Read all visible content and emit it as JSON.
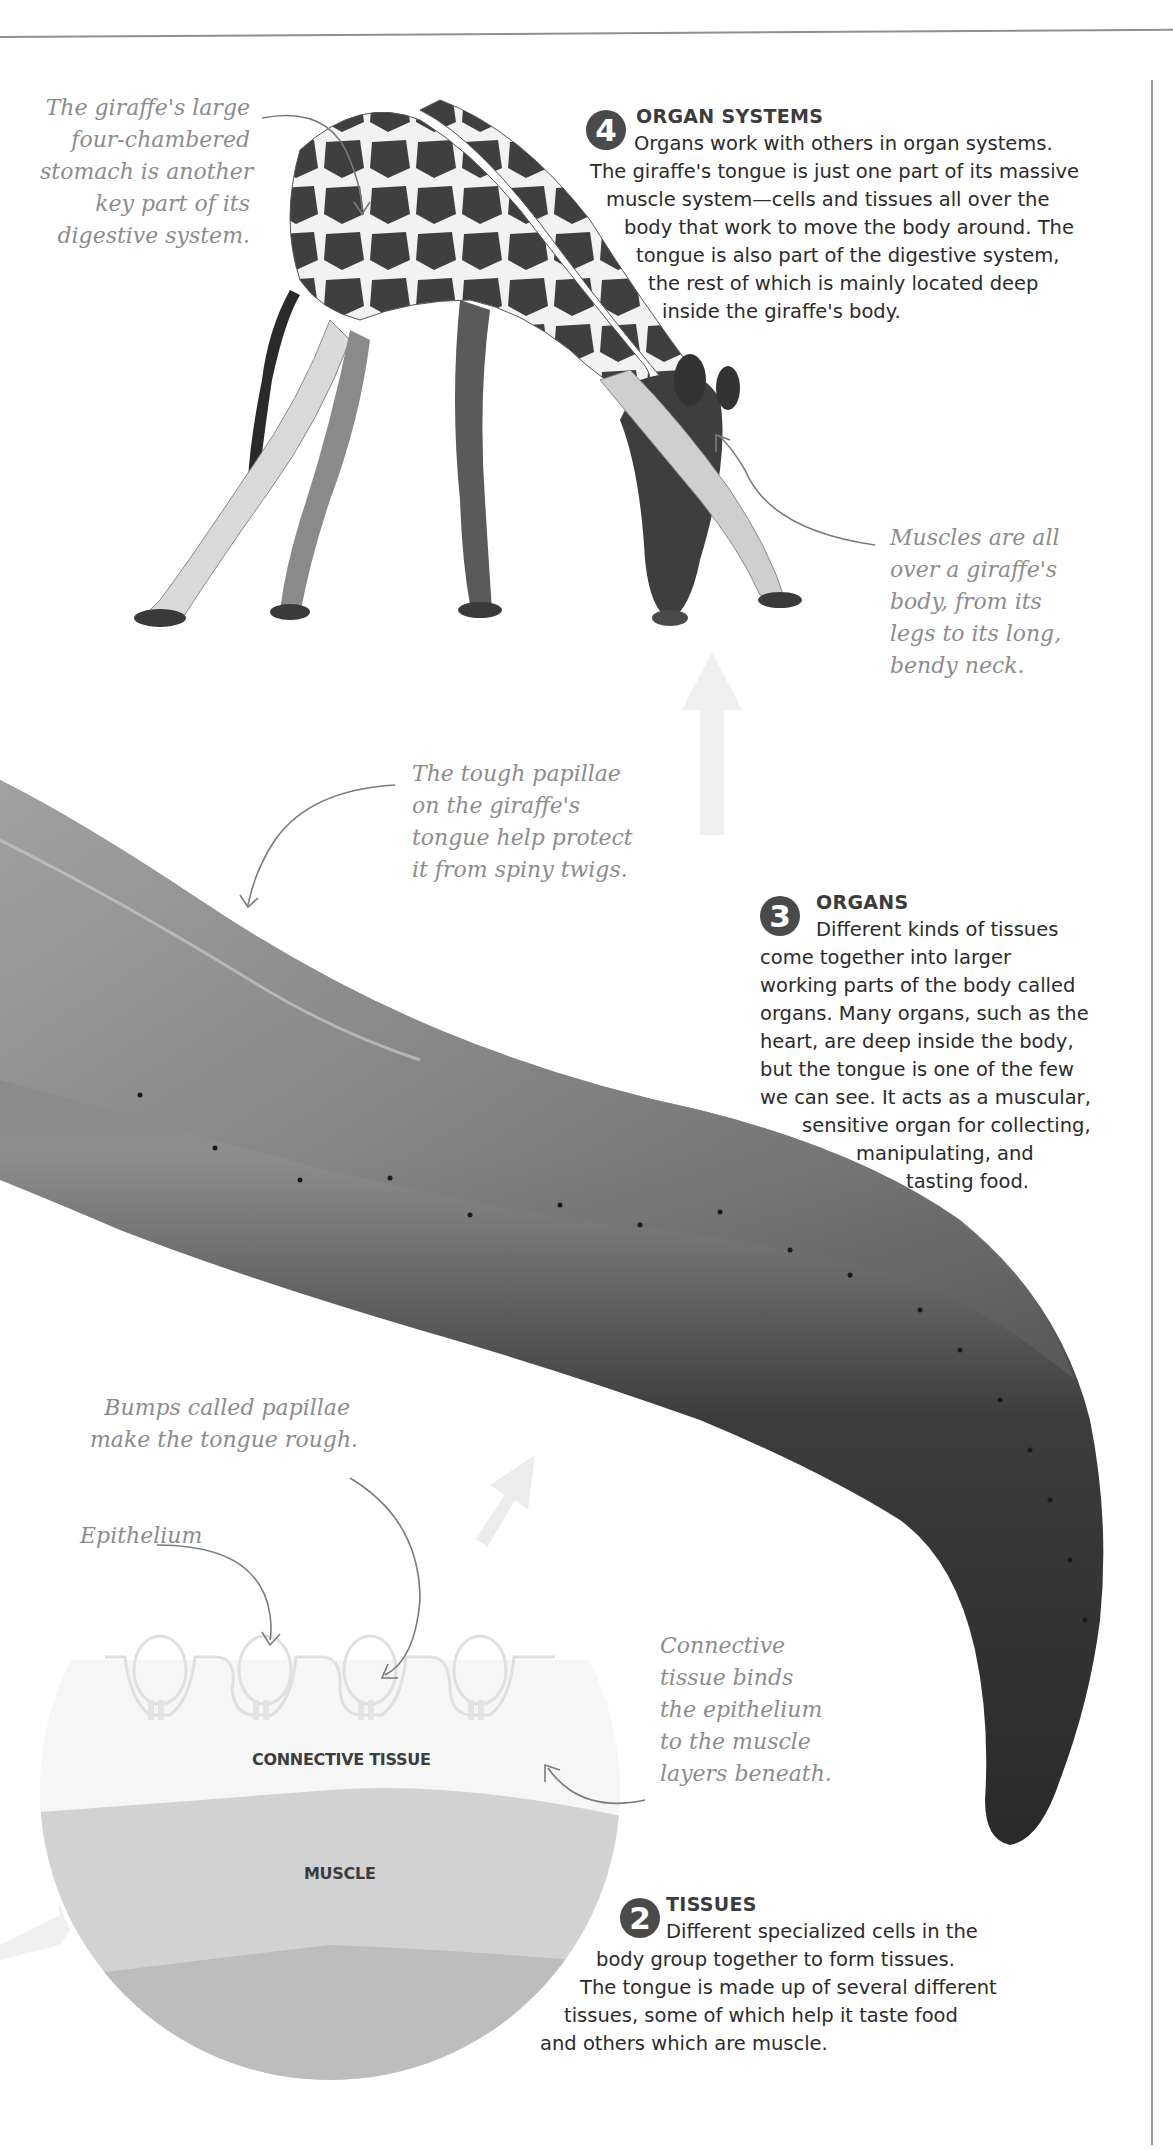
{
  "page": {
    "colors": {
      "text": "#2b2b2b",
      "annotation": "#8c8c8c",
      "badge": "#4a4a4a",
      "rule": "#8f8f8f"
    }
  },
  "sections": {
    "organ_systems": {
      "number": "4",
      "title": "ORGAN SYSTEMS",
      "lines": [
        "Organs work with others in organ systems.",
        "The giraffe's tongue is just one part of its massive",
        "muscle system—cells and tissues all over the",
        "body that work to move the body around. The",
        "tongue is also part of the digestive system,",
        "the rest of which is mainly located deep",
        "inside the giraffe's body."
      ]
    },
    "organs": {
      "number": "3",
      "title": "ORGANS",
      "lines": [
        "Different kinds of tissues",
        "come together into larger",
        "working parts of the body called",
        "organs. Many organs, such as the",
        "heart, are deep inside the body,",
        "but the tongue is one of the few",
        "we can see. It acts as a muscular,",
        "sensitive organ for collecting,",
        "manipulating, and",
        "tasting food."
      ]
    },
    "tissues": {
      "number": "2",
      "title": "TISSUES",
      "lines": [
        "Different specialized cells in the",
        "body group together to form tissues.",
        "The tongue is made up of several different",
        "tissues, some of which help it taste food",
        "and others which are muscle."
      ]
    }
  },
  "annotations": {
    "stomach": [
      "The giraffe's large",
      "four-chambered",
      "stomach is another",
      "key part of its",
      "digestive system."
    ],
    "muscles": [
      "Muscles are all",
      "over a giraffe's",
      "body, from its",
      "legs to its long,",
      "bendy neck."
    ],
    "papillae_tough": [
      "The tough papillae",
      "on the giraffe's",
      "tongue help protect",
      "it from spiny twigs."
    ],
    "bumps": [
      "Bumps called papillae",
      "make the tongue rough."
    ],
    "epithelium": [
      "Epithelium"
    ],
    "connective": [
      "Connective",
      "tissue binds",
      "the epithelium",
      "to the muscle",
      "layers beneath."
    ]
  },
  "diagram": {
    "layers": {
      "connective_tissue": "CONNECTIVE TISSUE",
      "muscle": "MUSCLE"
    }
  },
  "images": {
    "giraffe": "giraffe bending down, photo",
    "tongue": "giraffe tongue close-up, photo"
  }
}
